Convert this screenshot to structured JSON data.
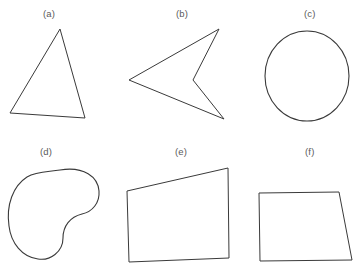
{
  "figure": {
    "background_color": "#ffffff",
    "stroke_color": "#3a3a3a",
    "label_color": "#5a5a5a",
    "width": 356,
    "height": 276,
    "panels": [
      {
        "id": "a",
        "label": "(a)",
        "shape_name": "triangle",
        "label_x": 50,
        "label_y": 8,
        "geometry": {
          "type": "polygon",
          "points": "60,29 85,118 10,113"
        }
      },
      {
        "id": "b",
        "label": "(b)",
        "shape_name": "concave-arrow",
        "label_x": 183,
        "label_y": 8,
        "geometry": {
          "type": "polygon",
          "points": "219,29 193,80 224,119 129,80"
        }
      },
      {
        "id": "c",
        "label": "(c)",
        "shape_name": "circle",
        "label_x": 311,
        "label_y": 8,
        "geometry": {
          "type": "ellipse",
          "cx": 307,
          "cy": 76,
          "rx": 42,
          "ry": 45
        }
      },
      {
        "id": "d",
        "label": "(d)",
        "shape_name": "kidney-bean",
        "label_x": 47,
        "label_y": 146,
        "geometry": {
          "type": "path",
          "d": "M 60,170 C 84,166 98,177 99,191 C 100,203 92,212 82,214 C 70,217 63,226 63,238 C 63,252 50,261 38,259 C 22,257 11,243 9,226 C 6,205 13,186 27,177 C 37,171 49,172 60,170 Z"
        }
      },
      {
        "id": "e",
        "label": "(e)",
        "shape_name": "parallelogram",
        "label_x": 182,
        "label_y": 146,
        "geometry": {
          "type": "polygon",
          "points": "228,168 229,258 129,262 127,191"
        }
      },
      {
        "id": "f",
        "label": "(f)",
        "shape_name": "trapezoid",
        "label_x": 311,
        "label_y": 146,
        "geometry": {
          "type": "polygon",
          "points": "259,193 339,192 352,260 260,261"
        }
      }
    ]
  }
}
